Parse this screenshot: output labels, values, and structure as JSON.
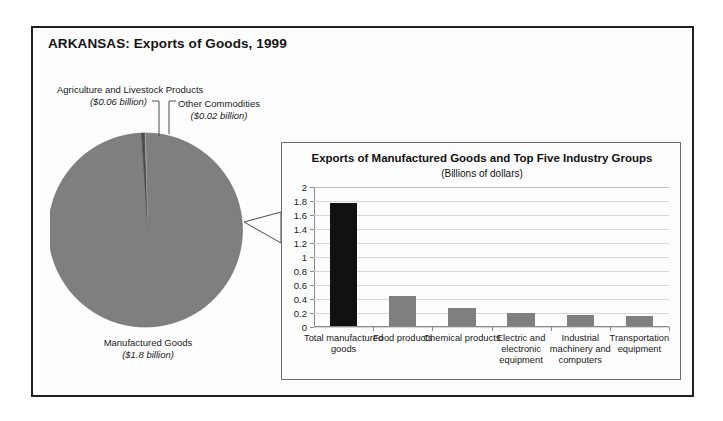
{
  "title": "ARKANSAS: Exports of Goods, 1999",
  "pie": {
    "labels": {
      "agriculture": {
        "name": "Agriculture and Livestock Products",
        "value": "($0.06 billion)"
      },
      "other": {
        "name": "Other Commodities",
        "value": "($0.02 billion)"
      },
      "manufactured": {
        "name": "Manufactured Goods",
        "value": "($1.8 billion)"
      }
    }
  },
  "bar_panel": {
    "title": "Exports of Manufactured Goods and Top Five Industry Groups",
    "subtitle": "(Billions of dollars)"
  },
  "colors": {
    "frame": "#231f20",
    "pie_manufactured": "#7f7f7f",
    "pie_agriculture": "#4d4d4d",
    "pie_other": "#c9c9c9",
    "bar_total": "#111111",
    "bar_group": "#7f7f7f"
  },
  "chart_data": [
    {
      "type": "pie",
      "title": "ARKANSAS: Exports of Goods, 1999",
      "unit": "billions of dollars",
      "categories": [
        "Manufactured Goods",
        "Agriculture and Livestock Products",
        "Other Commodities"
      ],
      "values": [
        1.8,
        0.06,
        0.02
      ],
      "value_labels": [
        "($1.8 billion)",
        "($0.06 billion)",
        "($0.02 billion)"
      ],
      "colors": [
        "#7f7f7f",
        "#4d4d4d",
        "#c9c9c9"
      ],
      "legend": "none"
    },
    {
      "type": "bar",
      "title": "Exports of Manufactured Goods and Top Five Industry Groups",
      "subtitle": "(Billions of dollars)",
      "xlabel": "",
      "ylabel": "",
      "ylim": [
        0,
        2
      ],
      "yticks": [
        0,
        0.2,
        0.4,
        0.6,
        0.8,
        1,
        1.2,
        1.4,
        1.6,
        1.8,
        2
      ],
      "ytick_labels": [
        "0",
        "0.2",
        "0.4",
        "0.6",
        "0.8",
        "1",
        "1.2",
        "1.4",
        "1.6",
        "1.8",
        "2"
      ],
      "grid": true,
      "legend": "none",
      "categories": [
        "Total manufactured goods",
        "Food products",
        "Chemical products",
        "Electric and electronic equipment",
        "Industrial machinery and computers",
        "Transportation equipment"
      ],
      "values": [
        1.76,
        0.43,
        0.26,
        0.18,
        0.16,
        0.14
      ],
      "bar_colors": [
        "#111111",
        "#7f7f7f",
        "#7f7f7f",
        "#7f7f7f",
        "#7f7f7f",
        "#7f7f7f"
      ]
    }
  ]
}
